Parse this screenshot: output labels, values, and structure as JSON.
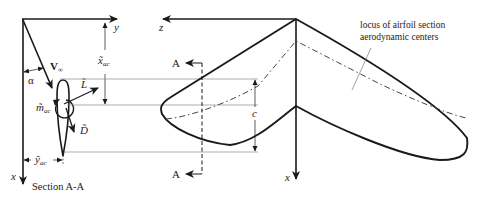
{
  "diagram": {
    "colors": {
      "line": "#1a1a1a",
      "thin": "#7a7a7a",
      "text": "#222222",
      "background": "#ffffff"
    },
    "section_view": {
      "caption": "Section A-A",
      "axis_y_label": "y",
      "axis_x_label": "x",
      "freestream_label": "V",
      "freestream_subscript": "∞",
      "angle_label": "α",
      "lift_label": "L̃",
      "drag_label": "D̃",
      "moment_label": "m̃",
      "moment_subscript": "ac",
      "x_ac_label": "x̃",
      "x_ac_subscript": "ac",
      "y_ac_label": "ỹ",
      "y_ac_subscript": "ac"
    },
    "planform_view": {
      "axis_z_label": "z",
      "axis_x_label": "x",
      "chord_label": "c",
      "section_marker_top": "A",
      "section_marker_bottom": "A",
      "annotation_line1": "locus of airfoil section",
      "annotation_line2": "aerodynamic centers"
    }
  }
}
